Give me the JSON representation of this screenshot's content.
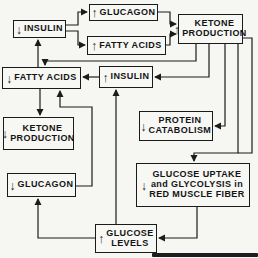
{
  "diagram": {
    "background_color": "#f6f6f3",
    "line_color": "#1b1b1b",
    "text_color": "#141414",
    "nodes": [
      {
        "id": "insulin-down",
        "direction": "down",
        "lines": [
          "INSULIN"
        ],
        "x": 13,
        "y": 20,
        "w": 53,
        "h": 18
      },
      {
        "id": "glucagon-up",
        "direction": "up",
        "lines": [
          "GLUCAGON"
        ],
        "x": 89,
        "y": 4,
        "w": 69,
        "h": 17
      },
      {
        "id": "fatty-acids-up",
        "direction": "up",
        "lines": [
          "FATTY ACIDS"
        ],
        "x": 87,
        "y": 36,
        "w": 79,
        "h": 19
      },
      {
        "id": "ketone-production-up",
        "direction": "up",
        "lines": [
          "KETONE",
          "PRODUCTION"
        ],
        "x": 178,
        "y": 14,
        "w": 65,
        "h": 30
      },
      {
        "id": "fatty-acids-down",
        "direction": "down",
        "lines": [
          "FATTY ACIDS"
        ],
        "x": 2,
        "y": 67,
        "w": 79,
        "h": 22
      },
      {
        "id": "insulin-up",
        "direction": "up",
        "lines": [
          "INSULIN"
        ],
        "x": 99,
        "y": 66,
        "w": 54,
        "h": 22
      },
      {
        "id": "protein-catabolism-down",
        "direction": "down",
        "lines": [
          "PROTEIN",
          "CATABOLISM"
        ],
        "x": 139,
        "y": 111,
        "w": 74,
        "h": 30
      },
      {
        "id": "ketone-production-down",
        "direction": "down",
        "lines": [
          "KETONE",
          "PRODUCTION"
        ],
        "x": 3,
        "y": 117,
        "w": 71,
        "h": 33
      },
      {
        "id": "glucagon-down",
        "direction": "down",
        "lines": [
          "GLUCAGON"
        ],
        "x": 7,
        "y": 173,
        "w": 69,
        "h": 24
      },
      {
        "id": "glucose-uptake-down",
        "direction": "down",
        "lines": [
          "GLUCOSE UPTAKE",
          "and GLYCOLYSIS in",
          "RED MUSCLE FIBER"
        ],
        "x": 136,
        "y": 163,
        "w": 114,
        "h": 44
      },
      {
        "id": "glucose-levels-up",
        "direction": "up",
        "lines": [
          "GLUCOSE",
          "LEVELS"
        ],
        "x": 95,
        "y": 224,
        "w": 62,
        "h": 29
      }
    ],
    "edges": [
      {
        "from": "insulin-down",
        "to": "glucagon-up",
        "arrow": true,
        "points": [
          [
            66,
            25
          ],
          [
            78,
            25
          ],
          [
            78,
            12
          ],
          [
            87,
            12
          ]
        ]
      },
      {
        "from": "insulin-down",
        "to": "fatty-acids-up",
        "arrow": true,
        "points": [
          [
            66,
            31
          ],
          [
            78,
            31
          ],
          [
            78,
            45
          ],
          [
            85,
            45
          ]
        ]
      },
      {
        "from": "glucagon-up",
        "to": "ketone-production-up",
        "arrow": true,
        "points": [
          [
            158,
            12
          ],
          [
            170,
            12
          ],
          [
            170,
            24
          ],
          [
            176,
            24
          ]
        ]
      },
      {
        "from": "fatty-acids-up",
        "to": "ketone-production-up",
        "arrow": true,
        "points": [
          [
            166,
            45
          ],
          [
            170,
            45
          ],
          [
            170,
            34
          ],
          [
            176,
            34
          ]
        ]
      },
      {
        "from": "ketone-production-up",
        "to": "fatty-acids-down",
        "arrow": true,
        "points": [
          [
            196,
            44
          ],
          [
            196,
            61
          ],
          [
            45,
            61
          ],
          [
            45,
            65
          ]
        ]
      },
      {
        "from": "ketone-production-up",
        "to": "insulin-up",
        "arrow": true,
        "points": [
          [
            209,
            44
          ],
          [
            209,
            77
          ],
          [
            155,
            77
          ]
        ]
      },
      {
        "from": "ketone-production-up",
        "to": "protein-catabolism-down",
        "arrow": true,
        "points": [
          [
            225,
            44
          ],
          [
            225,
            126
          ],
          [
            215,
            126
          ]
        ]
      },
      {
        "from": "ketone-production-up",
        "to": "glucose-uptake-down",
        "arrow": true,
        "points": [
          [
            238,
            44
          ],
          [
            238,
            153
          ],
          [
            194,
            153
          ],
          [
            194,
            161
          ]
        ]
      },
      {
        "from": "ketone-production-up",
        "to": "glucose-uptake-junction",
        "arrow": false,
        "points": [
          [
            243,
            38
          ],
          [
            252,
            38
          ],
          [
            252,
            153
          ],
          [
            238,
            153
          ]
        ]
      },
      {
        "from": "insulin-up",
        "to": "fatty-acids-down",
        "arrow": true,
        "points": [
          [
            99,
            77
          ],
          [
            83,
            77
          ]
        ]
      },
      {
        "from": "fatty-acids-down",
        "to": "insulin-down",
        "arrow": true,
        "points": [
          [
            38,
            67
          ],
          [
            38,
            40
          ]
        ]
      },
      {
        "from": "fatty-acids-down",
        "to": "ketone-production-down",
        "arrow": true,
        "points": [
          [
            40,
            89
          ],
          [
            40,
            115
          ]
        ]
      },
      {
        "from": "glucagon-down",
        "to": "fatty-acids-down",
        "arrow": true,
        "points": [
          [
            76,
            186
          ],
          [
            92,
            186
          ],
          [
            92,
            107
          ],
          [
            60,
            107
          ],
          [
            60,
            91
          ]
        ]
      },
      {
        "from": "glucose-levels-up",
        "to": "insulin-up",
        "arrow": true,
        "points": [
          [
            116,
            224
          ],
          [
            116,
            90
          ]
        ]
      },
      {
        "from": "glucose-levels-up",
        "to": "glucagon-down",
        "arrow": true,
        "points": [
          [
            95,
            238
          ],
          [
            38,
            238
          ],
          [
            38,
            199
          ]
        ]
      },
      {
        "from": "glucose-uptake-down",
        "to": "glucose-levels-up",
        "arrow": true,
        "points": [
          [
            197,
            207
          ],
          [
            197,
            238
          ],
          [
            159,
            238
          ]
        ]
      }
    ],
    "icons": {
      "up": "up-arrow-icon",
      "down": "down-arrow-icon"
    },
    "scan_artifact": {
      "x": 152,
      "y": 253,
      "w": 106,
      "h": 4
    }
  }
}
